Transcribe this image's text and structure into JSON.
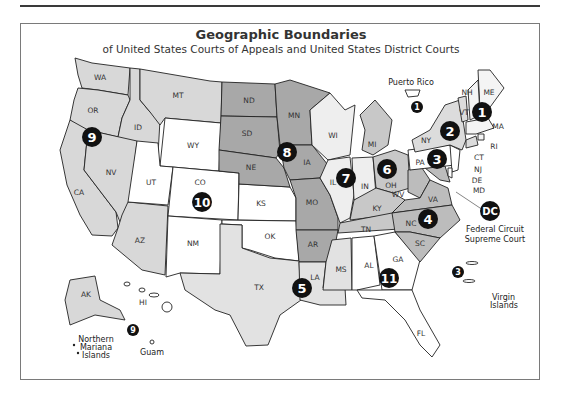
{
  "header": {
    "title": "Geographic Boundaries",
    "subtitle": "of United States Courts of Appeals and United States District Courts"
  },
  "colors": {
    "circuit_1": "#f4f4f4",
    "circuit_2": "#dcdcdc",
    "circuit_3": "#ffffff",
    "circuit_4": "#bcbcbc",
    "circuit_5": "#e2e2e2",
    "circuit_6": "#c8c8c8",
    "circuit_7": "#eeeeee",
    "circuit_8": "#a8a8a8",
    "circuit_9": "#d8d8d8",
    "circuit_10": "#ffffff",
    "circuit_11": "#ffffff",
    "badge": "#111111",
    "border": "#222222"
  },
  "states": {
    "WA": "WA",
    "OR": "OR",
    "CA": "CA",
    "ID": "ID",
    "NV": "NV",
    "MT": "MT",
    "AZ": "AZ",
    "WY": "WY",
    "UT": "UT",
    "CO": "CO",
    "NM": "NM",
    "KS": "KS",
    "OK": "OK",
    "ND": "ND",
    "SD": "SD",
    "NE": "NE",
    "MN": "MN",
    "IA": "IA",
    "MO": "MO",
    "AR": "AR",
    "WI": "WI",
    "IL": "IL",
    "IN": "IN",
    "MI": "MI",
    "OH": "OH",
    "KY": "KY",
    "TN": "TN",
    "TX": "TX",
    "LA": "LA",
    "MS": "MS",
    "AL": "AL",
    "GA": "GA",
    "FL": "FL",
    "WV": "WV",
    "VA": "VA",
    "NC": "NC",
    "SC": "SC",
    "MD": "MD",
    "DE": "DE",
    "PA": "PA",
    "NJ": "NJ",
    "NY": "NY",
    "VT": "VT",
    "CT": "CT",
    "NH": "NH",
    "ME": "ME",
    "MA": "MA",
    "RI": "RI",
    "AK": "AK",
    "HI": "HI"
  },
  "circuits": [
    {
      "id": "1",
      "label": "1"
    },
    {
      "id": "1pr",
      "label": "1"
    },
    {
      "id": "2",
      "label": "2"
    },
    {
      "id": "3",
      "label": "3"
    },
    {
      "id": "3vi",
      "label": "3"
    },
    {
      "id": "4",
      "label": "4"
    },
    {
      "id": "5",
      "label": "5"
    },
    {
      "id": "6",
      "label": "6"
    },
    {
      "id": "7",
      "label": "7"
    },
    {
      "id": "8",
      "label": "8"
    },
    {
      "id": "9",
      "label": "9"
    },
    {
      "id": "9pac",
      "label": "9"
    },
    {
      "id": "10",
      "label": "10"
    },
    {
      "id": "11",
      "label": "11"
    },
    {
      "id": "DC",
      "label": "DC"
    }
  ],
  "territories": {
    "puerto_rico": "Puerto Rico",
    "virgin_islands_line1": "Virgin",
    "virgin_islands_line2": "Islands",
    "nmi_line1": "Northern",
    "nmi_line2": "Mariana",
    "nmi_line3": "Islands",
    "guam": "Guam"
  },
  "dc_note": {
    "line1": "Federal Circuit",
    "line2": "Supreme Court"
  }
}
